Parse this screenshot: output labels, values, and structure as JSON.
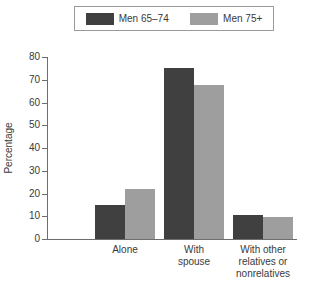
{
  "legend": {
    "entries": [
      {
        "label": "Men 65–74",
        "color": "#404040",
        "name": "men-65-74"
      },
      {
        "label": "Men 75+",
        "color": "#9e9e9e",
        "name": "men-75-plus"
      }
    ]
  },
  "axes": {
    "y_title": "Percentage",
    "y_ticks": [
      "0",
      "10",
      "20",
      "30",
      "40",
      "50",
      "60",
      "70",
      "80"
    ]
  },
  "chart_data": {
    "type": "bar",
    "title": "",
    "xlabel": "",
    "ylabel": "Percentage",
    "ylim": [
      0,
      80
    ],
    "ytick_step": 10,
    "grid": false,
    "legend_position": "top",
    "categories": [
      "Alone",
      "With spouse",
      "With other relatives or nonrelatives"
    ],
    "category_lines": [
      [
        "Alone"
      ],
      [
        "With",
        "spouse"
      ],
      [
        "With other",
        "relatives or",
        "nonrelatives"
      ]
    ],
    "series": [
      {
        "name": "Men 65–74",
        "color": "#404040",
        "values": [
          15,
          75,
          10.5
        ]
      },
      {
        "name": "Men 75+",
        "color": "#9e9e9e",
        "values": [
          22,
          67.5,
          9.5
        ]
      }
    ]
  }
}
